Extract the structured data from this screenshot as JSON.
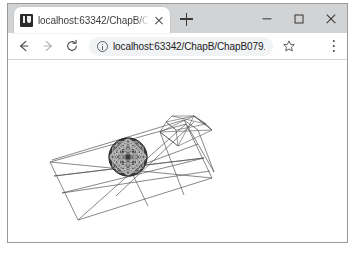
{
  "window": {
    "controls": {
      "minimize_label": "Minimize",
      "maximize_label": "Maximize",
      "close_label": "Close"
    }
  },
  "tab_strip": {
    "tabs": [
      {
        "favicon": "intellij-idea-icon",
        "title": "localhost:63342/ChapB/ChapB",
        "close_label": "Close tab"
      }
    ],
    "new_tab_label": "New tab"
  },
  "toolbar": {
    "back_label": "Back",
    "forward_label": "Forward",
    "reload_label": "Reload",
    "site_info_icon": "info-circle-icon",
    "url": "localhost:63342/ChapB/ChapB079.ht...",
    "url_placeholder": "Search Google or type a URL",
    "bookmark_icon": "star-icon",
    "profile_icon": "account-avatar-icon",
    "menu_icon": "three-dot-menu-icon"
  },
  "page": {
    "title": "",
    "background": "#ffffff",
    "graphic": {
      "name": "3d-wireframe-scene",
      "description": "Tilted wireframe quadrilateral plane with subdivision lines, a small wireframe box/pyramid at the upper right, and a dark dense mesh sphere at the center",
      "stroke_color": "#555555",
      "sphere_color": "#3a3a3a",
      "sphere_center": [
        155,
        178
      ],
      "sphere_radius": 19
    }
  }
}
